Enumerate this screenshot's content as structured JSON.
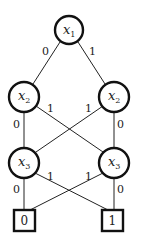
{
  "diagram": {
    "type": "binary-decision-diagram",
    "nodes": [
      {
        "id": "x1",
        "var": "x",
        "sub": "1"
      },
      {
        "id": "x2a",
        "var": "x",
        "sub": "2"
      },
      {
        "id": "x2b",
        "var": "x",
        "sub": "2"
      },
      {
        "id": "x3a",
        "var": "x",
        "sub": "3"
      },
      {
        "id": "x3b",
        "var": "x",
        "sub": "3"
      }
    ],
    "terminals": [
      {
        "id": "t0",
        "label": "0"
      },
      {
        "id": "t1",
        "label": "1"
      }
    ],
    "edges": [
      {
        "from": "x1",
        "to": "x2a",
        "label": "0"
      },
      {
        "from": "x1",
        "to": "x2b",
        "label": "1"
      },
      {
        "from": "x2a",
        "to": "x3a",
        "label": "0"
      },
      {
        "from": "x2a",
        "to": "x3b",
        "label": "1"
      },
      {
        "from": "x2b",
        "to": "x3a",
        "label": "1"
      },
      {
        "from": "x2b",
        "to": "x3b",
        "label": "0"
      },
      {
        "from": "x3a",
        "to": "t0",
        "label": "0"
      },
      {
        "from": "x3a",
        "to": "t1",
        "label": "1"
      },
      {
        "from": "x3b",
        "to": "t0",
        "label": "1"
      },
      {
        "from": "x3b",
        "to": "t1",
        "label": "0"
      }
    ]
  }
}
